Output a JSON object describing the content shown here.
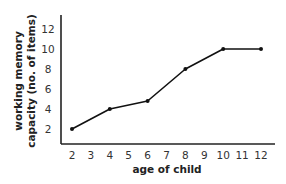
{
  "chart_data": {
    "type": "line",
    "title": "",
    "xlabel": "age of child",
    "ylabel_lines": [
      "working memory",
      "capacity (no. of items)"
    ],
    "ylabel": "working memory capacity (no. of items)",
    "x_ticks": [
      "2",
      "3",
      "4",
      "5",
      "6",
      "7",
      "8",
      "9",
      "10",
      "11",
      "12"
    ],
    "y_ticks": [
      "2",
      "4",
      "6",
      "8",
      "10",
      "12"
    ],
    "xlim": [
      2,
      12
    ],
    "ylim": [
      0,
      13
    ],
    "grid": false,
    "legend": null,
    "series": [
      {
        "name": "working memory capacity",
        "x": [
          2,
          4,
          6,
          8,
          10,
          12
        ],
        "values": [
          2,
          4,
          4.8,
          8,
          10,
          10
        ]
      }
    ],
    "colors": {
      "line": "#111111",
      "axis": "#222222"
    }
  }
}
